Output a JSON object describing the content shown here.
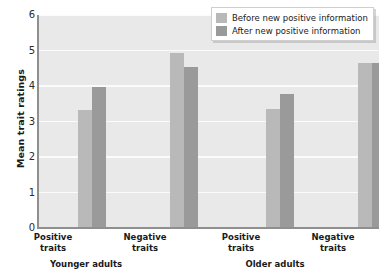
{
  "chart_data": {
    "type": "bar",
    "title": "",
    "xlabel": "",
    "ylabel": "Mean trait ratings",
    "ylim": [
      0,
      6
    ],
    "yticks": [
      0,
      1,
      2,
      3,
      4,
      5,
      6
    ],
    "ytick_labels": [
      "0",
      "1",
      "2",
      "3",
      "4",
      "5",
      "6"
    ],
    "grid": true,
    "legend_position": "top-right",
    "categories": [
      "Positive traits",
      "Negative traits",
      "Positive traits",
      "Negative traits"
    ],
    "category_lines": [
      {
        "line1": "Positive",
        "line2": "traits"
      },
      {
        "line1": "Negative",
        "line2": "traits"
      },
      {
        "line1": "Positive",
        "line2": "traits"
      },
      {
        "line1": "Negative",
        "line2": "traits"
      }
    ],
    "groups": [
      {
        "name": "Younger adults",
        "categories": [
          "Positive traits",
          "Negative traits"
        ]
      },
      {
        "name": "Older adults",
        "categories": [
          "Positive traits",
          "Negative traits"
        ]
      }
    ],
    "series": [
      {
        "name": "Before new positive information",
        "color": "#b9b9b9",
        "values": [
          3.33,
          4.93,
          3.36,
          4.66
        ]
      },
      {
        "name": "After new positive information",
        "color": "#9a9a9a",
        "values": [
          3.96,
          4.53,
          3.78,
          4.65
        ]
      }
    ]
  },
  "legend": {
    "items": [
      {
        "label": "Before new positive information",
        "color": "#b9b9b9"
      },
      {
        "label": "After new positive information",
        "color": "#9a9a9a"
      }
    ]
  },
  "axes": {
    "y_title": "Mean trait ratings",
    "y_tick_labels": [
      "6",
      "5",
      "4",
      "3",
      "2",
      "1",
      "0"
    ]
  },
  "group_labels": [
    "Younger adults",
    "Older adults"
  ],
  "colors": {
    "plot_background": "#e9e9e9",
    "gridline": "#fbfbfb",
    "axis": "#8f8f8f",
    "before_bar": "#b9b9b9",
    "after_bar": "#9a9a9a",
    "text": "#1a1a1a"
  }
}
